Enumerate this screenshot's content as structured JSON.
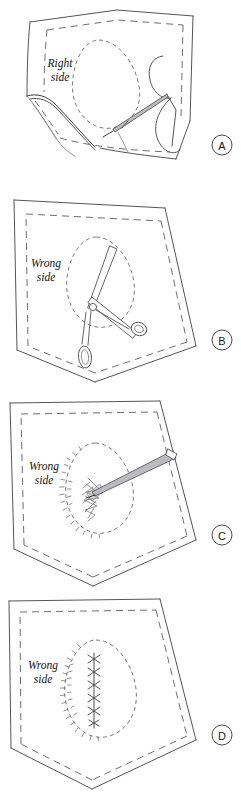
{
  "document": {
    "title": "Buttonhole / Bound Opening Construction Sequence",
    "subject": "sewing-instruction-diagram",
    "background_color": "#ffffff",
    "ink_color": "#555558",
    "panel_count": 4
  },
  "panels": [
    {
      "id": "A",
      "letter": "A",
      "fabric_label_line1": "Right",
      "fabric_label_line2": "side",
      "fabric_label_full": "Right side",
      "description": "Fabric piece shown right side up with lower-left corner folded back; a threaded needle stitches along the marked teardrop outline near the right edge.",
      "tools": [
        "needle",
        "thread"
      ],
      "marking": "teardrop-dashed-outline",
      "has_folded_corner": true
    },
    {
      "id": "B",
      "letter": "B",
      "fabric_label_line1": "Wrong",
      "fabric_label_line2": "side",
      "fabric_label_full": "Wrong side",
      "description": "Fabric shown wrong side up; scissors cut a slash down the centre of the stitched teardrop outline.",
      "tools": [
        "scissors"
      ],
      "marking": "teardrop-dashed-outline",
      "has_folded_corner": false
    },
    {
      "id": "C",
      "letter": "C",
      "fabric_label_line1": "Wrong",
      "fabric_label_line2": "side",
      "fabric_label_full": "Wrong side",
      "description": "Wrong side up; a pointed awl / stiletto is pushed through the cut opening to turn and shape the raw edges, which are now frayed.",
      "tools": [
        "awl"
      ],
      "marking": "teardrop-dashed-outline",
      "has_folded_corner": false
    },
    {
      "id": "D",
      "letter": "D",
      "fabric_label_line1": "Wrong",
      "fabric_label_line2": "side",
      "fabric_label_full": "Wrong side",
      "description": "Wrong side up; the slashed opening is closed with a row of cross stitches down the centre of the teardrop.",
      "tools": [],
      "marking": "teardrop-dashed-outline",
      "stitch_type": "cross-stitch",
      "stitch_count": 6,
      "has_folded_corner": false
    }
  ]
}
